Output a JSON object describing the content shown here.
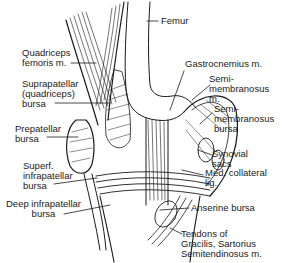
{
  "figure": {
    "colors": {
      "ink": "#1a1a1a",
      "background": "#ffffff"
    }
  },
  "labels": {
    "femur": "Femur",
    "quadriceps_femoris": "Quadriceps\nfemoris m.",
    "suprapatellar_bursa": "Suprapatellar\n(quadriceps)\nbursa",
    "prepatellar_bursa": "Prepatellar\nbursa",
    "superf_infrapatellar_bursa": "Superf.\ninfrapatellar\nbursa",
    "deep_infrapatellar_bursa": "Deep infrapatellar\nbursa",
    "gastrocnemius": "Gastrocnemius m.",
    "semimembranosus_m": "Semi-\nmembranosus\nm.",
    "semimembranosus_bursa": "Semi-\nmembranosus\nbursa",
    "synovial_sacs": "Synovial\nsacs",
    "med_collateral_lig": "Med. collateral\nlig.",
    "anserine_bursa": "Anserine bursa",
    "tendons": "Tendons of\nGracilis, Sartorius\nSemitendinosus m."
  }
}
